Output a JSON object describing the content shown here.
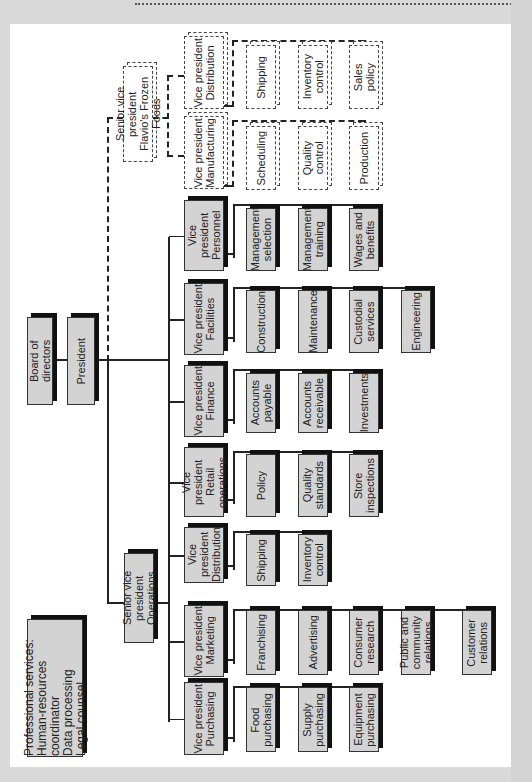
{
  "chart_title": "Organization chart (rotated 90°)",
  "board": {
    "label": "Board of directors"
  },
  "president": {
    "label": "President"
  },
  "professional_services": {
    "label": "Professional services:\nHuman-resources coordinator\nData processing\nLegal counsel"
  },
  "svp_operations": {
    "label": "Senior vice president\nOperations"
  },
  "svp_frozen": {
    "label": "Senior vice president\nFlavio's Frozen Foods"
  },
  "divisions": [
    {
      "id": "purchasing",
      "label": "Vice president\nPurchasing",
      "departments": [
        "Food\npurchasing",
        "Supply\npurchasing",
        "Equipment\npurchasing"
      ]
    },
    {
      "id": "marketing",
      "label": "Vice president\nMarketing",
      "departments": [
        "Franchising",
        "Advertising",
        "Consumer\nresearch",
        "Public and\ncommunity\nrelations",
        "Customer\nrelations"
      ]
    },
    {
      "id": "distribution",
      "label": "Vice president\nDistribution",
      "departments": [
        "Shipping",
        "Inventory\ncontrol"
      ]
    },
    {
      "id": "retail",
      "label": "Vice president\nRetail\noperations",
      "departments": [
        "Policy",
        "Quality\nstandards",
        "Store\ninspections"
      ]
    },
    {
      "id": "finance",
      "label": "Vice president\nFinance",
      "departments": [
        "Accounts\npayable",
        "Accounts\nreceivable",
        "Investments"
      ]
    },
    {
      "id": "facilities",
      "label": "Vice president\nFacilities",
      "departments": [
        "Construction",
        "Maintenance",
        "Custodial\nservices",
        "Engineering"
      ]
    },
    {
      "id": "personnel",
      "label": "Vice president\nPersonnel",
      "departments": [
        "Management\nselection",
        "Management\ntraining",
        "Wages and\nbenefits"
      ]
    }
  ],
  "frozen_divisions": [
    {
      "id": "manufacturing",
      "label": "Vice president\nManufacturing",
      "departments": [
        "Scheduling",
        "Quality\ncontrol",
        "Production"
      ]
    },
    {
      "id": "frozen-distribution",
      "label": "Vice president\nDistribution",
      "departments": [
        "Shipping",
        "Inventory\ncontrol",
        "Sales\npolicy"
      ]
    }
  ],
  "colors": {
    "box_fill": "#d3d3d3",
    "shadow": "#111111",
    "line": "#222222",
    "page": "#ffffff",
    "background": "#d9d9d9"
  }
}
